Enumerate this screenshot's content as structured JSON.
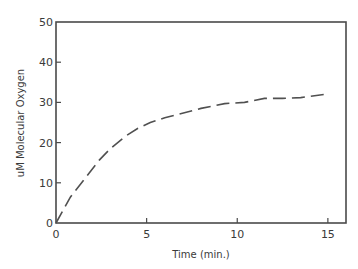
{
  "chart_data": {
    "type": "line",
    "title": "",
    "xlabel": "Time (min.)",
    "ylabel": "uM Molecular Oxygen",
    "xlim": [
      0,
      16
    ],
    "ylim": [
      0,
      50
    ],
    "xticks": [
      0,
      5,
      10,
      15
    ],
    "yticks": [
      0,
      10,
      20,
      30,
      40,
      50
    ],
    "xtick_labels": [
      "0",
      "5",
      "10",
      "15"
    ],
    "ytick_labels": [
      "0",
      "10",
      "20",
      "30",
      "40",
      "50"
    ],
    "grid": false,
    "legend": null,
    "series": [
      {
        "name": "Molecular Oxygen",
        "style": "dashed",
        "color": "#505050",
        "x": [
          0,
          0.8,
          1.5,
          2.4,
          3.0,
          3.8,
          4.5,
          5.2,
          6.0,
          6.7,
          8.0,
          9.3,
          10.4,
          11.5,
          12.5,
          13.5,
          14.8
        ],
        "y": [
          0,
          6.5,
          10.5,
          15.7,
          18.5,
          21.5,
          23.5,
          25.0,
          26.2,
          27.0,
          28.5,
          29.7,
          30.0,
          31.0,
          31.0,
          31.2,
          32.0
        ]
      }
    ]
  }
}
